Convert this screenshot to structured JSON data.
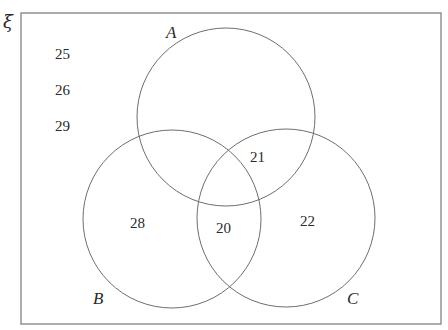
{
  "diagram": {
    "type": "venn",
    "universe": {
      "label": "ξ",
      "outside_values": [
        "25",
        "26",
        "29"
      ]
    },
    "sets": [
      {
        "id": "A",
        "label": "A"
      },
      {
        "id": "B",
        "label": "B"
      },
      {
        "id": "C",
        "label": "C"
      }
    ],
    "regions": {
      "B_only": "28",
      "A_and_C": "21",
      "B_and_C": "20",
      "C_only": "22"
    }
  }
}
